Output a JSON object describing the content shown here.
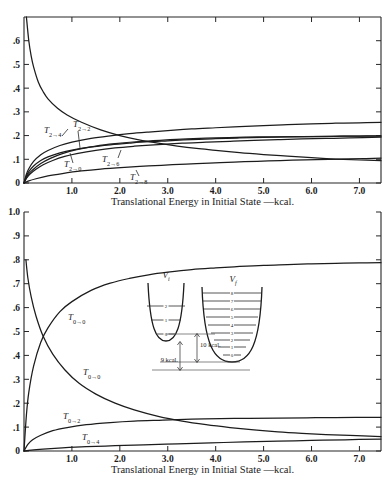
{
  "figure": {
    "background": "#ffffff",
    "ink": "#1a1a1a"
  },
  "chart_data": [
    {
      "id": "top",
      "type": "line",
      "title": "",
      "xlabel": "Translational Energy in Initial State —kcal.",
      "ylabel": "",
      "xlim": [
        0,
        7.45
      ],
      "ylim": [
        0,
        0.7
      ],
      "xticks": [
        "1.0",
        "2.0",
        "3.0",
        "4.0",
        "5.0",
        "6.0",
        "7.0"
      ],
      "xtickvalues": [
        1.0,
        2.0,
        3.0,
        4.0,
        5.0,
        6.0,
        7.0
      ],
      "yticks": [
        "0",
        ".1",
        ".2",
        ".3",
        ".4",
        ".5",
        ".6"
      ],
      "ytickvalues": [
        0,
        0.1,
        0.2,
        0.3,
        0.4,
        0.5,
        0.6
      ],
      "grid": false,
      "legend": "inline-curve-labels",
      "series": [
        {
          "name": "T_{2→2}",
          "label": "T",
          "sub_from": "2",
          "sub_to": "2",
          "x": [
            0.05,
            0.1,
            0.15,
            0.2,
            0.3,
            0.4,
            0.5,
            0.7,
            0.9,
            1.2,
            1.6,
            2.0,
            2.4,
            2.8,
            3.2,
            3.6,
            4.0,
            4.5,
            5.0,
            5.5,
            6.0,
            6.5,
            7.0,
            7.45
          ],
          "y": [
            0.7,
            0.6,
            0.535,
            0.49,
            0.425,
            0.385,
            0.355,
            0.315,
            0.287,
            0.256,
            0.224,
            0.2,
            0.182,
            0.168,
            0.156,
            0.146,
            0.138,
            0.128,
            0.12,
            0.113,
            0.107,
            0.101,
            0.097,
            0.094
          ]
        },
        {
          "name": "T_{2→4}",
          "label": "T",
          "sub_from": "2",
          "sub_to": "4",
          "x": [
            0.0,
            0.05,
            0.1,
            0.2,
            0.35,
            0.5,
            0.75,
            1.0,
            1.4,
            1.8,
            2.2,
            2.6,
            3.0,
            3.5,
            4.0,
            4.5,
            5.0,
            5.5,
            6.0,
            6.5,
            7.0,
            7.45
          ],
          "y": [
            0.0,
            0.037,
            0.06,
            0.091,
            0.119,
            0.137,
            0.158,
            0.172,
            0.188,
            0.199,
            0.208,
            0.215,
            0.221,
            0.228,
            0.233,
            0.238,
            0.242,
            0.246,
            0.249,
            0.252,
            0.254,
            0.256
          ]
        },
        {
          "name": "T_{2→0}",
          "label": "T",
          "sub_from": "2",
          "sub_to": "0",
          "x": [
            0.0,
            0.05,
            0.1,
            0.2,
            0.35,
            0.5,
            0.75,
            1.0,
            1.4,
            1.8,
            2.2,
            2.6,
            3.0,
            3.5,
            4.0,
            4.5,
            5.0,
            5.5,
            6.0,
            6.5,
            7.0,
            7.45
          ],
          "y": [
            0.0,
            0.03,
            0.048,
            0.072,
            0.095,
            0.11,
            0.127,
            0.139,
            0.152,
            0.161,
            0.168,
            0.174,
            0.178,
            0.183,
            0.187,
            0.19,
            0.192,
            0.194,
            0.196,
            0.197,
            0.198,
            0.199
          ]
        },
        {
          "name": "T_{2→6}",
          "label": "T",
          "sub_from": "2",
          "sub_to": "6",
          "x": [
            0.0,
            0.06,
            0.12,
            0.25,
            0.4,
            0.6,
            0.85,
            1.1,
            1.5,
            1.9,
            2.3,
            2.8,
            3.3,
            3.8,
            4.3,
            4.8,
            5.3,
            5.8,
            6.3,
            6.8,
            7.45
          ],
          "y": [
            0.0,
            0.022,
            0.037,
            0.058,
            0.077,
            0.095,
            0.112,
            0.124,
            0.138,
            0.148,
            0.155,
            0.162,
            0.168,
            0.172,
            0.176,
            0.18,
            0.183,
            0.186,
            0.188,
            0.19,
            0.193
          ]
        },
        {
          "name": "T_{2→8}",
          "label": "T",
          "sub_from": "2",
          "sub_to": "8",
          "x": [
            0.0,
            0.1,
            0.25,
            0.5,
            0.8,
            1.2,
            1.6,
            2.1,
            2.6,
            3.1,
            3.6,
            4.1,
            4.6,
            5.1,
            5.6,
            6.1,
            6.6,
            7.1,
            7.45
          ],
          "y": [
            0.0,
            0.009,
            0.018,
            0.03,
            0.04,
            0.051,
            0.059,
            0.066,
            0.072,
            0.077,
            0.082,
            0.086,
            0.09,
            0.093,
            0.096,
            0.099,
            0.101,
            0.103,
            0.105
          ]
        },
        {
          "name": "T_{2→2}-upper-branch",
          "label": "",
          "sub_from": "",
          "sub_to": "",
          "x": [
            0.0,
            0.08,
            0.18,
            0.35,
            0.55,
            0.8,
            1.1,
            1.5,
            1.9,
            2.4,
            2.9,
            3.4,
            4.0,
            4.6,
            5.2,
            5.8,
            6.4,
            7.0,
            7.45
          ],
          "y": [
            0.0,
            0.034,
            0.055,
            0.082,
            0.104,
            0.124,
            0.141,
            0.156,
            0.166,
            0.175,
            0.181,
            0.186,
            0.19,
            0.193,
            0.195,
            0.196,
            0.197,
            0.1975,
            0.198
          ]
        }
      ],
      "curve_labels": [
        {
          "text": "T",
          "from": "2",
          "to": "4",
          "x_px": 44,
          "y_px": 133
        },
        {
          "text": "T",
          "from": "2",
          "to": "2",
          "x_px": 73,
          "y_px": 127
        },
        {
          "text": "T",
          "from": "2",
          "to": "0",
          "x_px": 64,
          "y_px": 167
        },
        {
          "text": "T",
          "from": "2",
          "to": "6",
          "x_px": 102,
          "y_px": 162
        },
        {
          "text": "T",
          "from": "2",
          "to": "8",
          "x_px": 130,
          "y_px": 180
        }
      ]
    },
    {
      "id": "bottom",
      "type": "line",
      "title": "",
      "xlabel": "Translational Energy in Initial State —kcal.",
      "ylabel": "",
      "xlim": [
        0,
        7.45
      ],
      "ylim": [
        0,
        1.0
      ],
      "xticks": [
        "1.0",
        "2.0",
        "3.0",
        "4.0",
        "5.0",
        "6.0",
        "7.0"
      ],
      "xtickvalues": [
        1.0,
        2.0,
        3.0,
        4.0,
        5.0,
        6.0,
        7.0
      ],
      "yticks": [
        "0",
        ".1",
        ".2",
        ".3",
        ".4",
        ".5",
        ".6",
        ".7",
        ".8",
        ".9",
        "1.0"
      ],
      "ytickvalues": [
        0,
        0.1,
        0.2,
        0.3,
        0.4,
        0.5,
        0.6,
        0.7,
        0.8,
        0.9,
        1.0
      ],
      "grid": false,
      "legend": "inline-curve-labels",
      "series": [
        {
          "name": "T_{0→0}-rising",
          "label": "T",
          "sub_from": "0",
          "sub_to": "0",
          "x": [
            0.0,
            0.05,
            0.1,
            0.2,
            0.35,
            0.5,
            0.75,
            1.0,
            1.4,
            1.8,
            2.2,
            2.6,
            3.0,
            3.5,
            4.0,
            4.5,
            5.0,
            5.5,
            6.0,
            6.5,
            7.0,
            7.45
          ],
          "y": [
            0.0,
            0.15,
            0.245,
            0.355,
            0.455,
            0.515,
            0.583,
            0.625,
            0.672,
            0.702,
            0.722,
            0.737,
            0.748,
            0.759,
            0.766,
            0.772,
            0.777,
            0.78,
            0.783,
            0.785,
            0.787,
            0.788
          ]
        },
        {
          "name": "T_{0→0}-falling",
          "label": "T",
          "sub_from": "0",
          "sub_to": "0",
          "x": [
            0.04,
            0.08,
            0.15,
            0.25,
            0.4,
            0.6,
            0.85,
            1.15,
            1.5,
            1.9,
            2.3,
            2.8,
            3.3,
            3.8,
            4.3,
            4.8,
            5.3,
            5.8,
            6.3,
            6.8,
            7.45
          ],
          "y": [
            0.8,
            0.725,
            0.645,
            0.565,
            0.48,
            0.405,
            0.34,
            0.283,
            0.238,
            0.2,
            0.172,
            0.145,
            0.125,
            0.11,
            0.098,
            0.088,
            0.08,
            0.074,
            0.069,
            0.065,
            0.06
          ]
        },
        {
          "name": "T_{0→2}",
          "label": "T",
          "sub_from": "0",
          "sub_to": "2",
          "x": [
            0.0,
            0.08,
            0.18,
            0.35,
            0.6,
            0.9,
            1.3,
            1.8,
            2.3,
            2.9,
            3.5,
            4.1,
            4.7,
            5.3,
            5.9,
            6.5,
            7.45
          ],
          "y": [
            0.0,
            0.028,
            0.047,
            0.066,
            0.085,
            0.098,
            0.11,
            0.119,
            0.125,
            0.129,
            0.133,
            0.135,
            0.137,
            0.138,
            0.139,
            0.14,
            0.141
          ]
        },
        {
          "name": "T_{0→4}",
          "label": "T",
          "sub_from": "0",
          "sub_to": "4",
          "x": [
            0.0,
            0.15,
            0.4,
            0.8,
            1.3,
            1.9,
            2.5,
            3.2,
            3.9,
            4.6,
            5.3,
            6.0,
            6.7,
            7.45
          ],
          "y": [
            0.0,
            0.004,
            0.008,
            0.013,
            0.018,
            0.022,
            0.026,
            0.03,
            0.034,
            0.038,
            0.041,
            0.044,
            0.047,
            0.05
          ]
        }
      ],
      "curve_labels": [
        {
          "text": "T",
          "from": "0",
          "to": "0",
          "x_px": 68,
          "y_px": 320
        },
        {
          "text": "T",
          "from": "0",
          "to": "0",
          "x_px": 83,
          "y_px": 375
        },
        {
          "text": "T",
          "from": "0",
          "to": "2",
          "x_px": 63,
          "y_px": 419
        },
        {
          "text": "T",
          "from": "0",
          "to": "4",
          "x_px": 82,
          "y_px": 440
        }
      ]
    }
  ],
  "inset": {
    "name": "potential-well-diagram",
    "initial_well": {
      "label": "V",
      "sublabel": "i",
      "levels": [
        "0",
        "1",
        "2"
      ]
    },
    "final_well": {
      "label": "V",
      "sublabel": "f",
      "levels": [
        "0",
        "1",
        "2",
        "3",
        "4",
        "5",
        "6",
        "7",
        "8"
      ]
    },
    "annotations": [
      {
        "name": "gap-10kcal",
        "text": "10 kcal."
      },
      {
        "name": "gap-9kcal",
        "text": "9 kcal."
      }
    ]
  }
}
